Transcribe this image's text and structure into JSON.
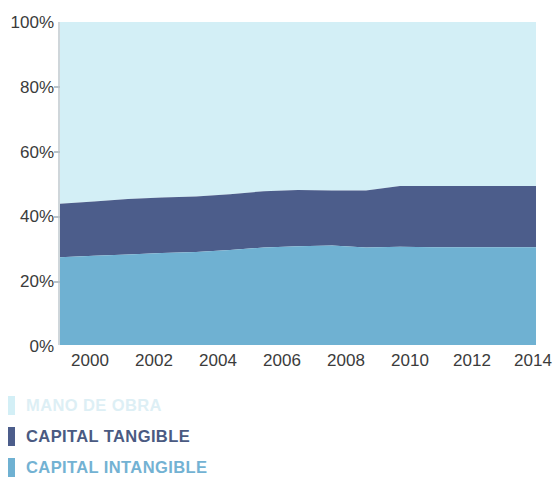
{
  "chart_data": {
    "type": "area",
    "stacked": true,
    "stacked_to_100": true,
    "title": "",
    "subtitle": "",
    "xlabel": "",
    "ylabel": "",
    "xlim": [
      2000,
      2014
    ],
    "ylim": [
      0,
      100
    ],
    "grid": false,
    "legend_position": "below",
    "x_tick_labels": [
      "2000",
      "2002",
      "2004",
      "2006",
      "2008",
      "2010",
      "2012",
      "2014"
    ],
    "x_tick_values": [
      2000,
      2002,
      2004,
      2006,
      2008,
      2010,
      2012,
      2014
    ],
    "y_tick_labels": [
      "0%",
      "20%",
      "40%",
      "60%",
      "80%",
      "100%"
    ],
    "y_tick_values": [
      0,
      20,
      40,
      60,
      80,
      100
    ],
    "x": [
      2000,
      2001,
      2002,
      2003,
      2004,
      2005,
      2006,
      2007,
      2008,
      2009,
      2010,
      2011,
      2012,
      2013,
      2014
    ],
    "series": [
      {
        "name": "CAPITAL INTANGIBLE",
        "color": "#6fb1d2",
        "stack_order": 1,
        "values": [
          27.2,
          27.6,
          28.0,
          28.5,
          28.8,
          29.4,
          30.2,
          30.6,
          30.8,
          30.2,
          30.4,
          30.3,
          30.3,
          30.3,
          30.3
        ]
      },
      {
        "name": "CAPITAL TANGIBLE",
        "color": "#4c5d8b",
        "stack_order": 2,
        "values": [
          16.5,
          16.8,
          17.2,
          17.2,
          17.2,
          17.3,
          17.4,
          17.4,
          17.0,
          17.6,
          18.8,
          18.9,
          18.9,
          18.9,
          18.9
        ]
      },
      {
        "name": "MANO DE OBRA",
        "color": "#d3eff6",
        "stack_order": 3,
        "values": [
          56.3,
          55.6,
          54.8,
          54.3,
          54.0,
          53.3,
          52.4,
          52.0,
          52.2,
          52.2,
          50.8,
          50.8,
          50.8,
          50.8,
          50.8
        ]
      }
    ],
    "cumulative_upper_bounds": {
      "capital_intangible": [
        27.2,
        27.6,
        28.0,
        28.5,
        28.8,
        29.4,
        30.2,
        30.6,
        30.8,
        30.2,
        30.4,
        30.3,
        30.3,
        30.3,
        30.3
      ],
      "capital_tangible": [
        43.7,
        44.4,
        45.2,
        45.7,
        46.0,
        46.7,
        47.6,
        48.0,
        47.8,
        47.8,
        49.2,
        49.2,
        49.2,
        49.2,
        49.2
      ],
      "mano_de_obra": [
        100,
        100,
        100,
        100,
        100,
        100,
        100,
        100,
        100,
        100,
        100,
        100,
        100,
        100,
        100
      ]
    }
  },
  "legend": {
    "items": [
      {
        "label": "MANO DE OBRA",
        "color": "#d3eff6",
        "text_color": "#ddeff5"
      },
      {
        "label": "CAPITAL TANGIBLE",
        "color": "#4c5d8b",
        "text_color": "#4a5a82"
      },
      {
        "label": "CAPITAL INTANGIBLE",
        "color": "#6fb1d2",
        "text_color": "#73b2d3"
      }
    ]
  },
  "axes": {
    "y_labels": [
      "100%",
      "80%",
      "60%",
      "40%",
      "20%",
      "0%"
    ],
    "x_labels": [
      "2000",
      "2002",
      "2004",
      "2006",
      "2008",
      "2010",
      "2012",
      "2014"
    ]
  },
  "colors": {
    "background": "#ffffff",
    "axis_text": "#3b3b3b",
    "axis_line": "#cfd6da",
    "mano_de_obra": "#d3eff6",
    "capital_tangible": "#4c5d8b",
    "capital_intangible": "#6fb1d2"
  }
}
